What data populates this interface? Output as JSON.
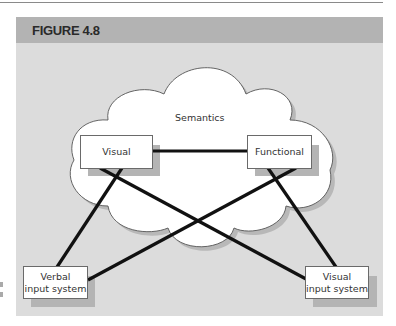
{
  "figure": {
    "title": "FIGURE 4.8"
  },
  "diagram": {
    "cloud_label": "Semantics",
    "nodes": {
      "visual": "Visual",
      "functional": "Functional",
      "verbal_input": {
        "line1": "Verbal",
        "line2": "input system"
      },
      "visual_input": {
        "line1": "Visual",
        "line2": "input system"
      }
    },
    "edges": [
      [
        "Visual",
        "Functional"
      ],
      [
        "Visual",
        "Verbal input system"
      ],
      [
        "Visual",
        "Visual input system"
      ],
      [
        "Functional",
        "Verbal input system"
      ],
      [
        "Functional",
        "Visual input system"
      ]
    ]
  },
  "colors": {
    "header": "#b3b3b3",
    "panel": "#dcdcdc",
    "line": "#111111",
    "box_border": "#6a6a6a"
  }
}
